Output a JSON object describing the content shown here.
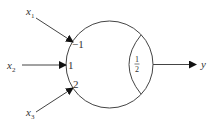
{
  "diagram": {
    "type": "perceptron-neuron",
    "inputs": [
      {
        "name": "x",
        "subscript": "1",
        "weight": "−1"
      },
      {
        "name": "x",
        "subscript": "2",
        "weight": "1"
      },
      {
        "name": "x",
        "subscript": "3",
        "weight": "2"
      }
    ],
    "threshold": {
      "numerator": "1",
      "denominator": "2"
    },
    "output": {
      "name": "y"
    },
    "colors": {
      "stroke": "#333333",
      "background": "#ffffff"
    }
  }
}
